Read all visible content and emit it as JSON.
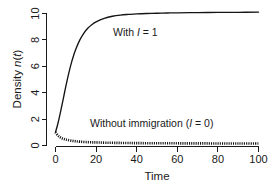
{
  "chart_data": {
    "type": "line",
    "title": "",
    "xlabel": "Time",
    "ylabel": "Density n(t)",
    "ylabel_parts": {
      "prefix": "Density ",
      "italic1": "n",
      "mid": "(",
      "italic2": "t",
      "suffix": ")"
    },
    "xlim": [
      0,
      100
    ],
    "ylim": [
      0,
      10.6
    ],
    "xticks": [
      0,
      20,
      40,
      60,
      80,
      100
    ],
    "xtick_labels": [
      "0",
      "20",
      "40",
      "60",
      "80",
      "100"
    ],
    "yticks": [
      0,
      2,
      4,
      6,
      8,
      10
    ],
    "ytick_labels": [
      "0",
      "2",
      "4",
      "6",
      "8",
      "10"
    ],
    "grid": false,
    "legend_position": "inline-annotations",
    "series": [
      {
        "name": "With I = 1",
        "style": "solid",
        "color": "#141414",
        "annotation": {
          "prefix": "With ",
          "italic": "I",
          "suffix": " = 1"
        },
        "x": [
          0,
          1,
          2,
          3,
          4,
          5,
          6,
          7,
          8,
          9,
          10,
          12,
          14,
          16,
          18,
          20,
          24,
          28,
          32,
          36,
          40,
          45,
          50,
          55,
          60,
          70,
          80,
          90,
          100
        ],
        "y": [
          1.0,
          1.55,
          2.2,
          2.92,
          3.67,
          4.42,
          5.12,
          5.77,
          6.35,
          6.86,
          7.3,
          8.0,
          8.52,
          8.9,
          9.17,
          9.37,
          9.63,
          9.79,
          9.88,
          9.93,
          9.97,
          10.0,
          10.02,
          10.04,
          10.05,
          10.07,
          10.08,
          10.09,
          10.1
        ]
      },
      {
        "name": "Without immigration (I = 0)",
        "style": "dotted",
        "color": "#141414",
        "annotation": {
          "prefix": "Without immigration (",
          "italic": "I",
          "suffix": " = 0)"
        },
        "x": [
          0,
          1,
          2,
          3,
          4,
          5,
          6,
          8,
          10,
          12,
          15,
          18,
          21,
          25,
          30,
          35,
          40,
          50,
          60,
          70,
          80,
          90,
          100
        ],
        "y": [
          1.0,
          0.78,
          0.65,
          0.56,
          0.5,
          0.45,
          0.42,
          0.36,
          0.32,
          0.29,
          0.26,
          0.24,
          0.23,
          0.21,
          0.2,
          0.19,
          0.18,
          0.17,
          0.165,
          0.16,
          0.155,
          0.15,
          0.15
        ]
      }
    ]
  },
  "annotations": {
    "upper": {
      "prefix": "With ",
      "italic": "I",
      "suffix": " = 1"
    },
    "lower": {
      "prefix": "Without immigration (",
      "italic": "I",
      "suffix": " = 0)"
    }
  },
  "axis": {
    "x_title": "Time",
    "y_title_prefix": "Density ",
    "y_title_italic_n": "n",
    "y_title_open": "(",
    "y_title_italic_t": "t",
    "y_title_close": ")"
  }
}
